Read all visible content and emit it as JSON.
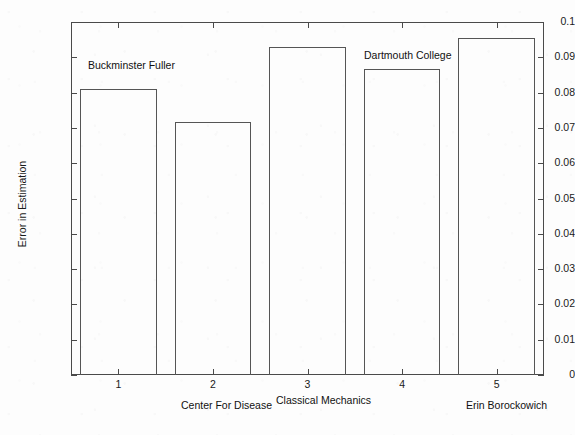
{
  "chart_data": {
    "type": "bar",
    "title": "",
    "xlabel": "",
    "ylabel": "Error in Estimation",
    "categories": [
      "1",
      "2",
      "3",
      "4",
      "5"
    ],
    "values": [
      0.081,
      0.0718,
      0.0928,
      0.0868,
      0.0955
    ],
    "ylim": [
      0,
      0.1
    ],
    "xlim": [
      0.5,
      5.5
    ],
    "grid": false,
    "legend": null,
    "ytick_labels": [
      "0",
      "0.01",
      "0.02",
      "0.03",
      "0.04",
      "0.05",
      "0.06",
      "0.07",
      "0.08",
      "0.09",
      "0.1"
    ],
    "ytick_values": [
      0,
      0.01,
      0.02,
      0.03,
      0.04,
      0.05,
      0.06,
      0.07,
      0.08,
      0.09,
      0.1
    ],
    "xtick_labels": [
      "1",
      "2",
      "3",
      "4",
      "5"
    ],
    "annotations": [
      {
        "text": "Buckminster Fuller",
        "x": 88,
        "y": 59
      },
      {
        "text": "Dartmouth College",
        "x": 364,
        "y": 49
      },
      {
        "text": "Center For Disease",
        "x": 181,
        "y": 399
      },
      {
        "text": "Classical Mechanics",
        "x": 276,
        "y": 394
      },
      {
        "text": "Erin Borockowich",
        "x": 466,
        "y": 399
      }
    ],
    "colors": {
      "bar_edge": "#555555",
      "bar_fill": "transparent",
      "axis": "#4a4a4a",
      "text": "#1a1a1a",
      "background": "#fdfdfd"
    }
  }
}
